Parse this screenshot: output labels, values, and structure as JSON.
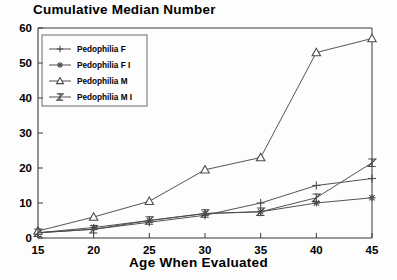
{
  "chart_data": {
    "type": "line",
    "title": "Cumulative Median Number",
    "xlabel": "Age When Evaluated",
    "ylabel": "",
    "x": [
      15,
      20,
      25,
      30,
      35,
      40,
      45
    ],
    "xticklabels": [
      "15",
      "20",
      "25",
      "30",
      "35",
      "40",
      "45"
    ],
    "yticklabels": [
      "0",
      "10",
      "20",
      "30",
      "40",
      "50",
      "60"
    ],
    "xlim": [
      15,
      45
    ],
    "ylim": [
      0,
      60
    ],
    "grid": false,
    "legend_position": "upper left",
    "series": [
      {
        "name": "Pedophilia F",
        "marker": "plus",
        "values": [
          1.5,
          2.5,
          4.5,
          6.5,
          10,
          15,
          17
        ]
      },
      {
        "name": "Pedophilia F I",
        "marker": "asterisk",
        "values": [
          1.5,
          3,
          5,
          7,
          7.5,
          10,
          11.5
        ]
      },
      {
        "name": "Pedophilia M",
        "marker": "triangle",
        "values": [
          2,
          6,
          10.5,
          19.5,
          23,
          53,
          57
        ]
      },
      {
        "name": "Pedophilia M I",
        "marker": "bowtie",
        "values": [
          1.5,
          2.5,
          5,
          7,
          7.5,
          11.5,
          21.5
        ]
      }
    ]
  },
  "axis": {
    "x_title": "Age When Evaluated"
  },
  "legend": {
    "entries": [
      {
        "label": "Pedophilia F",
        "marker": "plus-marker-icon"
      },
      {
        "label": "Pedophilia F I",
        "marker": "asterisk-marker-icon"
      },
      {
        "label": "Pedophilia M",
        "marker": "triangle-marker-icon"
      },
      {
        "label": "Pedophilia M I",
        "marker": "bowtie-marker-icon"
      }
    ]
  },
  "colors": {
    "line": "#4a4a4a",
    "axis": "#333333",
    "text": "#000000",
    "background": "#fdfdfd"
  }
}
